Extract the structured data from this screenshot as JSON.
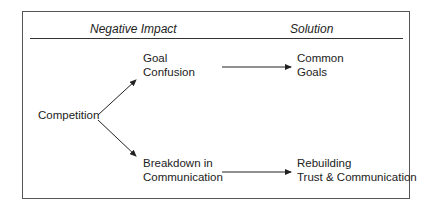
{
  "headers": {
    "left": "Negative Impact",
    "right": "Solution"
  },
  "nodes": {
    "root": "Competition",
    "impact_1_line1": "Goal",
    "impact_1_line2": "Confusion",
    "impact_2_line1": "Breakdown in",
    "impact_2_line2": "Communication",
    "solution_1_line1": "Common",
    "solution_1_line2": "Goals",
    "solution_2_line1": "Rebuilding",
    "solution_2_line2": "Trust & Communication"
  },
  "edges": [
    {
      "from": "Competition",
      "to": "Goal Confusion"
    },
    {
      "from": "Competition",
      "to": "Breakdown in Communication"
    },
    {
      "from": "Goal Confusion",
      "to": "Common Goals"
    },
    {
      "from": "Breakdown in Communication",
      "to": "Rebuilding Trust & Communication"
    }
  ]
}
